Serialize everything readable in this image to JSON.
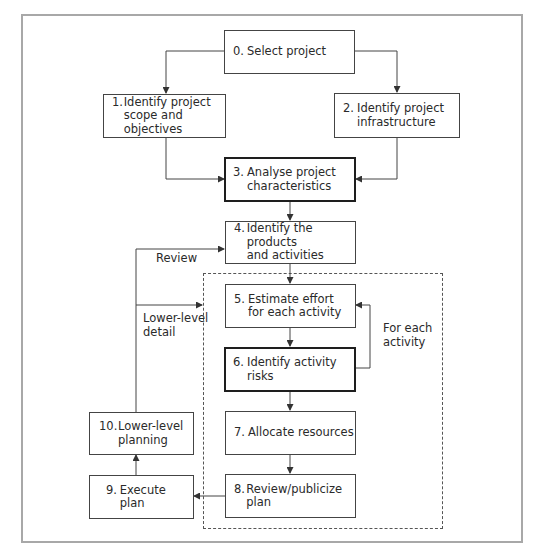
{
  "diagram": {
    "steps": [
      {
        "num": "0.",
        "line1": "Select project",
        "line2": ""
      },
      {
        "num": "1.",
        "line1": "Identify project",
        "line2": "scope and objectives"
      },
      {
        "num": "2.",
        "line1": "Identify project",
        "line2": "infrastructure"
      },
      {
        "num": "3.",
        "line1": "Analyse project",
        "line2": "characteristics"
      },
      {
        "num": "4.",
        "line1": "Identify the products",
        "line2": "and activities"
      },
      {
        "num": "5.",
        "line1": "Estimate effort",
        "line2": "for each activity"
      },
      {
        "num": "6.",
        "line1": "Identify activity",
        "line2": "risks"
      },
      {
        "num": "7.",
        "line1": "Allocate resources",
        "line2": ""
      },
      {
        "num": "8.",
        "line1": "Review/publicize plan",
        "line2": ""
      },
      {
        "num": "9.",
        "line1": "Execute plan",
        "line2": ""
      },
      {
        "num": "10.",
        "line1": "Lower-level",
        "line2": "planning"
      }
    ],
    "labels": {
      "review": "Review",
      "lower_level_1": "Lower-level",
      "lower_level_2": "detail",
      "for_each_1": "For each",
      "for_each_2": "activity"
    },
    "emphasized_steps": [
      "3.",
      "6."
    ],
    "colors": {
      "frame": "#a8a8a8",
      "line": "#444444",
      "thick_border": "#1e1e1e"
    }
  }
}
